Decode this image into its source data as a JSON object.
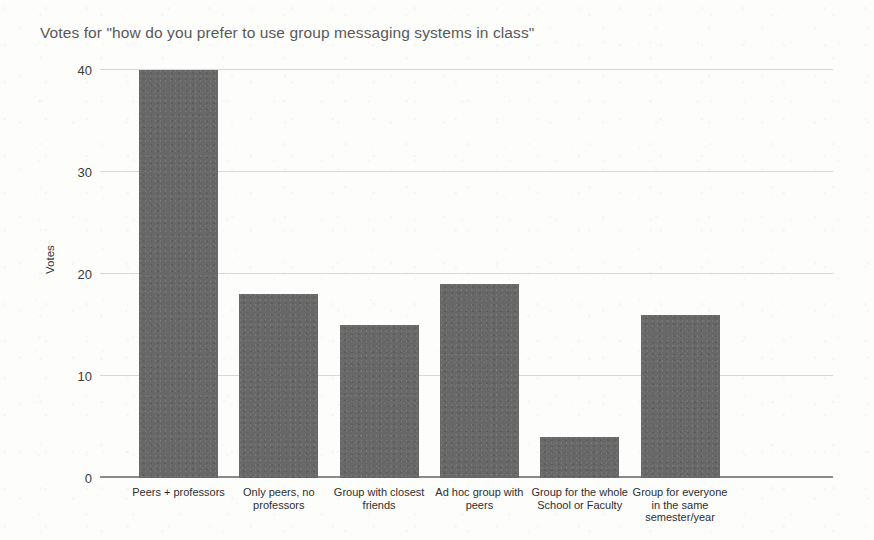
{
  "chart_data": {
    "type": "bar",
    "title": "Votes for \"how do you prefer to use group messaging systems in class\"",
    "xlabel": "",
    "ylabel": "Votes",
    "categories": [
      "Peers + professors",
      "Only peers, no\nprofessors",
      "Group with closest\nfriends",
      "Ad hoc group with\npeers",
      "Group for the whole\nSchool or Faculty",
      "Group for everyone\nin the same\nsemester/year"
    ],
    "values": [
      40,
      18,
      15,
      19,
      4,
      16
    ],
    "ylim": [
      0,
      40
    ],
    "yticks": [
      0,
      10,
      20,
      30,
      40
    ],
    "ytick_labels": [
      "0",
      "10",
      "20",
      "30",
      "40"
    ],
    "grid": true,
    "legend": false,
    "bar_color": "#686868",
    "gridline_color": "#d7d7d7",
    "axis_color": "#8a8a8a",
    "title_color": "#595959"
  },
  "artifacts": {
    "ghost_text": [
      "",
      "",
      "",
      ""
    ]
  }
}
